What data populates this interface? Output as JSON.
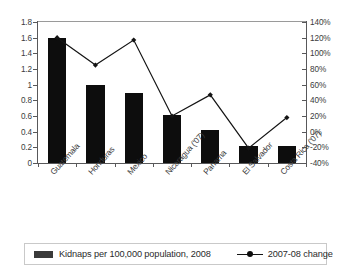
{
  "chart_data": {
    "type": "bar",
    "title": "",
    "subtitle": "",
    "xlabel": "",
    "ylabel": "",
    "categories": [
      "Guatemala",
      "Honduras",
      "Mexico",
      "Nicaragua ('07)",
      "Panama",
      "El Salvador",
      "Costa Rica ('07)"
    ],
    "series": [
      {
        "name": "Kidnaps per 100,000 population, 2008",
        "type": "bar",
        "axis": "left",
        "color": "#0d0d0d",
        "values": [
          1.6,
          1.0,
          0.9,
          0.61,
          0.42,
          0.22,
          0.22
        ]
      },
      {
        "name": "2007-08 change",
        "type": "line",
        "axis": "right",
        "color": "#141414",
        "marker": "diamond",
        "values": [
          120,
          85,
          117,
          20,
          47,
          -21,
          18
        ]
      }
    ],
    "axes": {
      "left": {
        "min": 0,
        "max": 1.8,
        "step": 0.2,
        "ticks": [
          "1.8",
          "1.6",
          "1.4",
          "1.2",
          "1",
          "0.8",
          "0.6",
          "0.4",
          "0.2",
          "0"
        ]
      },
      "right": {
        "min": -40,
        "max": 140,
        "step": 20,
        "unit": "%",
        "ticks": [
          "140%",
          "120%",
          "100%",
          "80%",
          "60%",
          "40%",
          "20%",
          "0%",
          "-20%",
          "-40%"
        ]
      }
    },
    "grid": false,
    "legend": {
      "position": "bottom",
      "entries": [
        {
          "label": "Kidnaps per 100,000 population, 2008",
          "marker": "bar-swatch"
        },
        {
          "label": "2007-08 change",
          "marker": "line-with-diamond"
        }
      ]
    }
  }
}
